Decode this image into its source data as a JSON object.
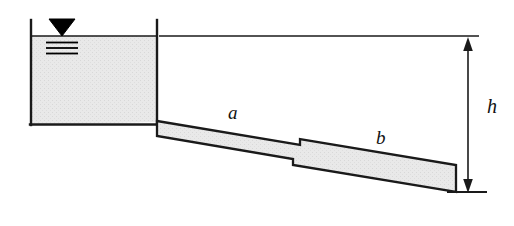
{
  "figure": {
    "type": "engineering-schematic",
    "background_color": "#ffffff",
    "line_color": "#1a1a1a",
    "fill_color": "#e8e8e8",
    "symbol_color": "#000000"
  },
  "labels": {
    "pipe_a": "a",
    "pipe_b": "b",
    "head": "h"
  },
  "icons": {
    "water_surface": "water-surface-triangle-icon",
    "dimension_arrow": "double-headed-vertical-arrow-icon"
  },
  "geometry": {
    "tank": {
      "left_x": 30,
      "right_x": 158,
      "top_y": 20,
      "bottom_y": 125,
      "water_surface_y": 36
    },
    "water_surface_symbol": {
      "triangle_center_x": 62,
      "triangle_apex_y": 36,
      "triangle_half_width": 13,
      "triangle_height": 17,
      "tick_count": 3,
      "tick_spacing": 5
    },
    "pipe_a": {
      "start_x": 158,
      "start_top_y": 121,
      "end_x": 300,
      "end_top_y": 145,
      "thickness": 13
    },
    "pipe_b": {
      "start_x": 300,
      "start_top_y": 139,
      "end_x": 456,
      "end_top_y": 165,
      "thickness": 27
    },
    "reference_line": {
      "y": 36,
      "from_x": 160,
      "to_x": 478
    },
    "dimension": {
      "x": 468,
      "top_y": 38,
      "bottom_y": 192,
      "lower_tick_from_x": 447,
      "lower_tick_to_x": 487
    }
  }
}
